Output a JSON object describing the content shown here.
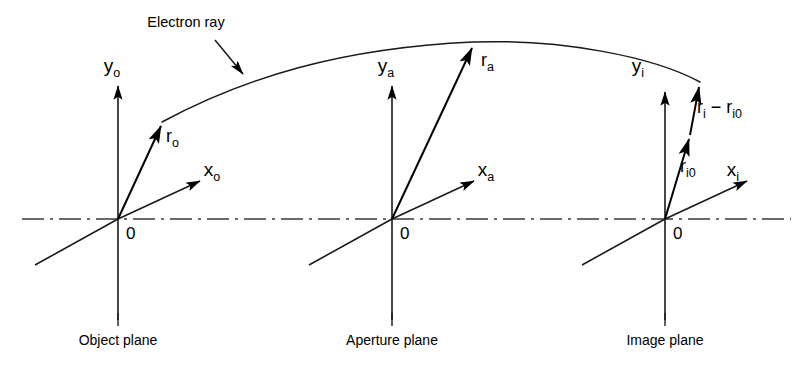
{
  "figure": {
    "name": "electron-ray-diagram",
    "background_color": "#ffffff",
    "ink_color": "#000000",
    "annotation": {
      "label": "Electron ray",
      "x": 186,
      "y": 27
    },
    "optical_axis": {
      "name": "optical-axis",
      "y": 219,
      "x_start": 22,
      "x_end": 791,
      "style": "dash-dot"
    },
    "ray": {
      "name": "electron-ray-curve",
      "start": [
        162,
        122
      ],
      "apex": [
        473,
        42
      ],
      "end": [
        700,
        82
      ]
    },
    "planes": [
      {
        "id": "object",
        "caption": "Object plane",
        "caption_x": 118,
        "caption_y": 341,
        "origin": [
          118,
          219
        ],
        "y_axis_label": "y",
        "y_axis_subscript": "o",
        "y_axis_label_x": 112,
        "y_axis_label_y": 72,
        "x_axis_label": "x",
        "x_axis_subscript": "o",
        "x_axis_label_x": 212,
        "x_axis_label_y": 176,
        "origin_label": "0",
        "origin_label_x": 126,
        "origin_label_y": 239,
        "vectors": [
          {
            "name": "r-o-vector",
            "label": "r",
            "subscript": "o",
            "label_x": 166,
            "label_y": 142,
            "from": [
              118,
              219
            ],
            "to": [
              162,
              122
            ]
          }
        ]
      },
      {
        "id": "aperture",
        "caption": "Aperture plane",
        "caption_x": 392,
        "caption_y": 341,
        "origin": [
          392,
          219
        ],
        "y_axis_label": "y",
        "y_axis_subscript": "a",
        "y_axis_label_x": 386,
        "y_axis_label_y": 72,
        "x_axis_label": "x",
        "x_axis_subscript": "a",
        "x_axis_label_x": 486,
        "x_axis_label_y": 176,
        "origin_label": "0",
        "origin_label_x": 400,
        "origin_label_y": 239,
        "vectors": [
          {
            "name": "r-a-vector",
            "label": "r",
            "subscript": "a",
            "label_x": 481,
            "label_y": 66,
            "from": [
              392,
              219
            ],
            "to": [
              473,
              44
            ]
          }
        ]
      },
      {
        "id": "image",
        "caption": "Image plane",
        "caption_x": 665,
        "caption_y": 341,
        "origin": [
          665,
          219
        ],
        "y_axis_label": "y",
        "y_axis_subscript": "i",
        "y_axis_label_x": 638,
        "y_axis_label_y": 72,
        "x_axis_label": "x",
        "x_axis_subscript": "i",
        "x_axis_label_x": 733,
        "x_axis_label_y": 176,
        "origin_label": "0",
        "origin_label_x": 673,
        "origin_label_y": 239,
        "vectors": [
          {
            "name": "r-i0-vector",
            "label": "r",
            "subscript": "i0",
            "label_x": 680,
            "label_y": 172,
            "from": [
              665,
              219
            ],
            "to": [
              690,
              135
            ]
          },
          {
            "name": "r-i-minus-r-i0-vector",
            "label": "r",
            "subscript": "i",
            "label2": " − r",
            "subscript2": "i0",
            "label_x": 697,
            "label_y": 113,
            "from": [
              690,
              135
            ],
            "to": [
              700,
              83
            ]
          }
        ]
      }
    ]
  }
}
